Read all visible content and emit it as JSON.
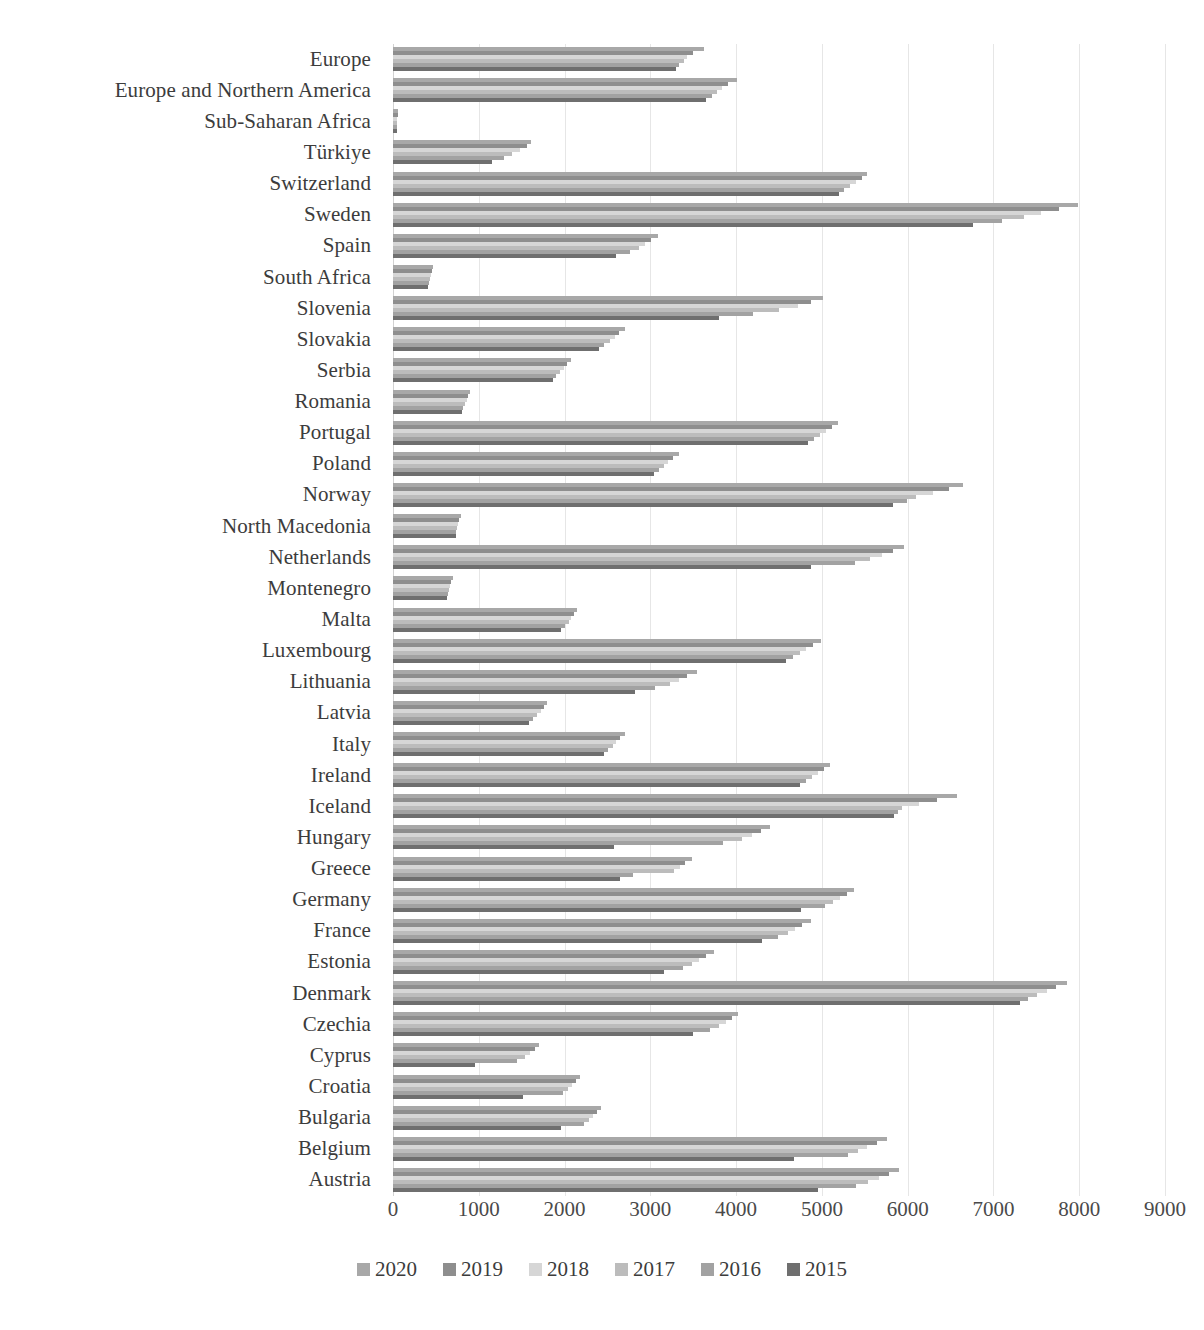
{
  "chart_data": {
    "type": "bar",
    "orientation": "horizontal",
    "title": "",
    "subtitle": "",
    "xlabel": "",
    "ylabel": "",
    "xlim": [
      0,
      9000
    ],
    "grid": true,
    "legend_position": "bottom",
    "xticks": [
      0,
      1000,
      2000,
      3000,
      4000,
      5000,
      6000,
      7000,
      8000,
      9000
    ],
    "xticklabels": [
      "0",
      "1000",
      "2000",
      "3000",
      "4000",
      "5000",
      "6000",
      "7000",
      "8000",
      "9000"
    ],
    "categories": [
      "Europe",
      "Europe and Northern America",
      "Sub-Saharan Africa",
      "Türkiye",
      "Switzerland",
      "Sweden",
      "Spain",
      "South Africa",
      "Slovenia",
      "Slovakia",
      "Serbia",
      "Romania",
      "Portugal",
      "Poland",
      "Norway",
      "North Macedonia",
      "Netherlands",
      "Montenegro",
      "Malta",
      "Luxembourg",
      "Lithuania",
      "Latvia",
      "Italy",
      "Ireland",
      "Iceland",
      "Hungary",
      "Greece",
      "Germany",
      "France",
      "Estonia",
      "Denmark",
      "Czechia",
      "Cyprus",
      "Croatia",
      "Bulgaria",
      "Belgium",
      "Austria"
    ],
    "series": [
      {
        "name": "2020",
        "color": "#a8a8a8",
        "values": [
          3620,
          4010,
          60,
          1610,
          5530,
          7980,
          3090,
          470,
          5010,
          2700,
          2070,
          900,
          5190,
          3330,
          6650,
          790,
          5960,
          700,
          2150,
          4990,
          3540,
          1800,
          2700,
          5100,
          6570,
          4400,
          3480,
          5380,
          4870,
          3740,
          7860,
          4020,
          1700,
          2180,
          2430,
          5760,
          5900
        ],
        "legend_label": "2020"
      },
      {
        "name": "2019",
        "color": "#8e8e8e",
        "values": [
          3500,
          3900,
          55,
          1560,
          5470,
          7760,
          3010,
          450,
          4870,
          2640,
          2030,
          880,
          5120,
          3270,
          6480,
          770,
          5830,
          680,
          2110,
          4900,
          3430,
          1760,
          2650,
          5030,
          6340,
          4290,
          3400,
          5290,
          4770,
          3650,
          7730,
          3950,
          1650,
          2130,
          2380,
          5640,
          5780
        ],
        "legend_label": "2019"
      },
      {
        "name": "2018",
        "color": "#d6d6d6",
        "values": [
          3430,
          3830,
          50,
          1480,
          5400,
          7560,
          2940,
          440,
          4720,
          2590,
          1990,
          860,
          5050,
          3210,
          6290,
          760,
          5700,
          660,
          2080,
          4820,
          3330,
          1720,
          2600,
          4960,
          6130,
          4180,
          3350,
          5210,
          4690,
          3570,
          7620,
          3880,
          1600,
          2090,
          2330,
          5530,
          5660
        ],
        "legend_label": "2018"
      },
      {
        "name": "2017",
        "color": "#bcbcbc",
        "values": [
          3390,
          3780,
          48,
          1390,
          5330,
          7360,
          2870,
          430,
          4500,
          2530,
          1950,
          840,
          4980,
          3160,
          6100,
          750,
          5560,
          650,
          2050,
          4740,
          3230,
          1680,
          2560,
          4890,
          5930,
          4070,
          3280,
          5130,
          4600,
          3480,
          7510,
          3800,
          1540,
          2040,
          2280,
          5420,
          5540
        ],
        "legend_label": "2017"
      },
      {
        "name": "2016",
        "color": "#a2a2a2",
        "values": [
          3340,
          3720,
          46,
          1290,
          5260,
          7100,
          2760,
          420,
          4200,
          2460,
          1900,
          820,
          4910,
          3100,
          5990,
          740,
          5390,
          640,
          2010,
          4660,
          3050,
          1630,
          2510,
          4820,
          5890,
          3850,
          2800,
          5040,
          4490,
          3380,
          7400,
          3700,
          1440,
          1980,
          2230,
          5310,
          5400
        ],
        "legend_label": "2016"
      },
      {
        "name": "2015",
        "color": "#6f6f6f",
        "values": [
          3300,
          3650,
          44,
          1150,
          5200,
          6760,
          2600,
          410,
          3800,
          2400,
          1860,
          800,
          4840,
          3040,
          5830,
          730,
          4870,
          630,
          1960,
          4580,
          2820,
          1580,
          2460,
          4750,
          5840,
          2580,
          2650,
          4760,
          4300,
          3160,
          7310,
          3500,
          960,
          1520,
          1960,
          4680,
          4950
        ]
      }
    ]
  }
}
